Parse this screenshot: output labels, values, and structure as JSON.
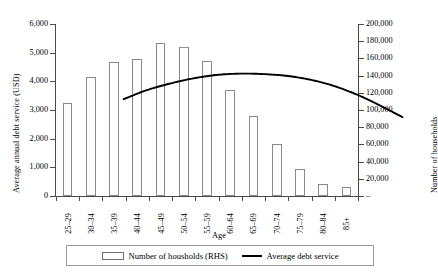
{
  "chart_data": {
    "type": "bar",
    "title": "",
    "xlabel": "Age",
    "categories": [
      "25–29",
      "30–34",
      "35–39",
      "40–44",
      "45–49",
      "50–54",
      "55–59",
      "60–64",
      "65–69",
      "70–74",
      "75–79",
      "80–84",
      "85+"
    ],
    "grid": false,
    "legend_position": "bottom",
    "axes": {
      "left": {
        "label": "Average annual debt service (USD)",
        "ylim": [
          0,
          6000
        ],
        "ticks": [
          0,
          1000,
          2000,
          3000,
          4000,
          5000,
          6000
        ],
        "ticklabels": [
          "0",
          "1,000",
          "2,000",
          "3,000",
          "4,000",
          "5,000",
          "6,000"
        ]
      },
      "right": {
        "label": "Number of households",
        "ylim": [
          0,
          200000
        ],
        "ticks": [
          0,
          20000,
          40000,
          60000,
          80000,
          100000,
          120000,
          140000,
          160000,
          180000,
          200000
        ],
        "ticklabels": [
          "–",
          "20,000",
          "40,000",
          "60,000",
          "80,000",
          "100,000",
          "120,000",
          "140,000",
          "160,000",
          "180,000",
          "200,000"
        ]
      }
    },
    "series": [
      {
        "name": "Number of housholds (RHS)",
        "type": "bar",
        "axis": "right",
        "unit": "households",
        "values": [
          108000,
          138500,
          156000,
          159500,
          177500,
          173000,
          157500,
          123500,
          92500,
          60500,
          31000,
          14000,
          11000
        ]
      },
      {
        "name": "Average debt service",
        "type": "line",
        "axis": "left",
        "unit": "USD",
        "values": [
          4215,
          4530,
          4760,
          4940,
          5060,
          5105,
          5090,
          5030,
          4900,
          4690,
          4390,
          4010,
          3590
        ]
      }
    ],
    "legend": [
      {
        "label": "Number of housholds (RHS)",
        "marker": "bar-swatch",
        "color": "#ffffff"
      },
      {
        "label": "Average debt service",
        "marker": "line-swatch",
        "color": "#000000"
      }
    ]
  },
  "colors": {
    "bar_fill": "#ffffff",
    "bar_stroke": "#8a8a8a",
    "line": "#000000",
    "axis": "#4a4a4a",
    "text": "#000000"
  }
}
